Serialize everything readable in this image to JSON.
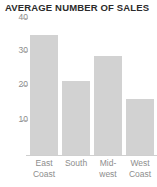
{
  "chart_data": {
    "type": "bar",
    "title": "AVERAGE NUMBER OF SALES",
    "xlabel": "",
    "ylabel": "",
    "categories": [
      "East Coast",
      "South",
      "Mid-west",
      "West Coast"
    ],
    "category_lines": [
      [
        "East",
        "Coast"
      ],
      [
        "South",
        ""
      ],
      [
        "Mid-",
        "west"
      ],
      [
        "West",
        "Coast"
      ]
    ],
    "values": [
      34,
      21,
      28,
      16
    ],
    "ylim": [
      0,
      40
    ],
    "yticks": [
      40,
      30,
      20,
      10
    ],
    "ytick_labels": [
      "40",
      "30",
      "20",
      "10"
    ],
    "grid": false,
    "legend": null,
    "bar_color": "#d2d2d2",
    "axis_color": "#cfcfcf",
    "tick_label_color": "#8d8d8d",
    "title_color": "#2b2b2b"
  }
}
